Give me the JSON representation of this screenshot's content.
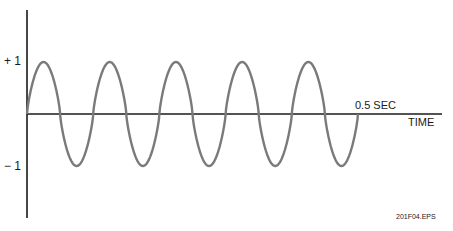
{
  "diagram": {
    "type": "sine-wave-time-plot",
    "y_labels": {
      "plus_one": "+ 1",
      "minus_one": "− 1"
    },
    "x_axis_label": "TIME",
    "marker_label": "0.5 SEC",
    "figure_id": "201F04.EPS",
    "cycles": 5,
    "duration_sec": 0.5,
    "amplitude": 1,
    "colors": {
      "axis": "#1a1a1a",
      "wave": "#7a7a7a",
      "text": "#1a1a1a"
    }
  }
}
